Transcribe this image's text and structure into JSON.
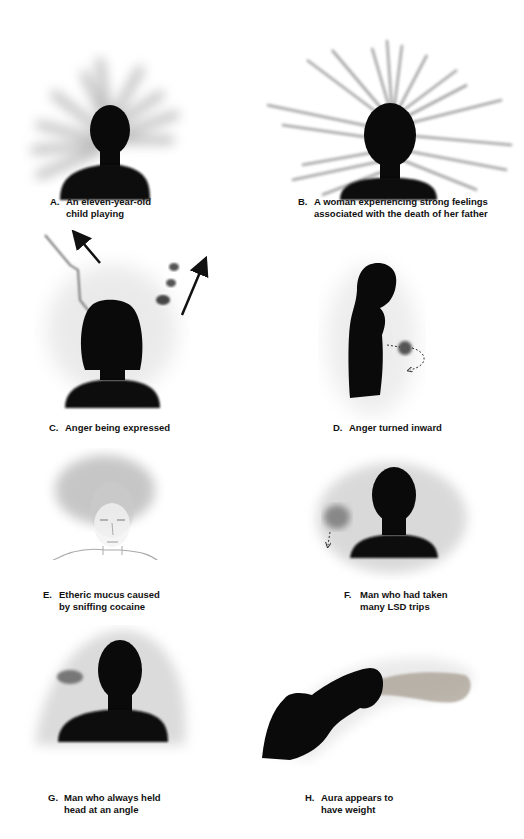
{
  "figures": [
    {
      "letter": "A.",
      "line1": "An eleven-year-old",
      "line2": "child playing",
      "icon": "child-aura-rays"
    },
    {
      "letter": "B.",
      "line1": "A woman experiencing strong feelings",
      "line2": "associated with the death of her father",
      "icon": "woman-aura-spikes"
    },
    {
      "letter": "C.",
      "line1": "Anger being expressed",
      "line2": "",
      "icon": "anger-expressed-arrows"
    },
    {
      "letter": "D.",
      "line1": "Anger turned inward",
      "line2": "",
      "icon": "anger-inward-profile"
    },
    {
      "letter": "E.",
      "line1": "Etheric mucus caused",
      "line2": "by sniffing cocaine",
      "icon": "sketched-face-mucus"
    },
    {
      "letter": "F.",
      "line1": "Man who had taken",
      "line2": "many LSD trips",
      "icon": "lsd-aura-patches"
    },
    {
      "letter": "G.",
      "line1": "Man who always held",
      "line2": "head at an angle",
      "icon": "tilted-head-aura"
    },
    {
      "letter": "H.",
      "line1": "Aura appears to",
      "line2": "have weight",
      "icon": "bent-figure-heavy-aura"
    }
  ],
  "colors": {
    "silhouette": "#0a0a0a",
    "aura": "#bdbdbd",
    "background": "#ffffff"
  }
}
